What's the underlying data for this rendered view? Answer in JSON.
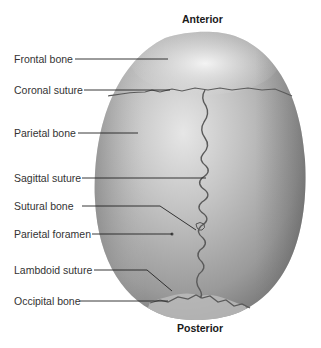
{
  "figure": {
    "title_top": "Anterior",
    "title_bottom": "Posterior",
    "labels": [
      {
        "id": "frontal-bone",
        "text": "Frontal bone"
      },
      {
        "id": "coronal-suture",
        "text": "Coronal suture"
      },
      {
        "id": "parietal-bone",
        "text": "Parietal bone"
      },
      {
        "id": "sagittal-suture",
        "text": "Sagittal suture"
      },
      {
        "id": "sutural-bone",
        "text": "Sutural bone"
      },
      {
        "id": "parietal-foramen",
        "text": "Parietal foramen"
      },
      {
        "id": "lambdoid-suture",
        "text": "Lambdoid suture"
      },
      {
        "id": "occipital-bone",
        "text": "Occipital bone"
      }
    ]
  },
  "colors": {
    "background": "#ffffff",
    "bone_light": "#e8e8e8",
    "bone_mid": "#b0b0b0",
    "bone_dark": "#6e6e6e",
    "suture": "#5a5a5a",
    "leader_line": "#222222"
  }
}
